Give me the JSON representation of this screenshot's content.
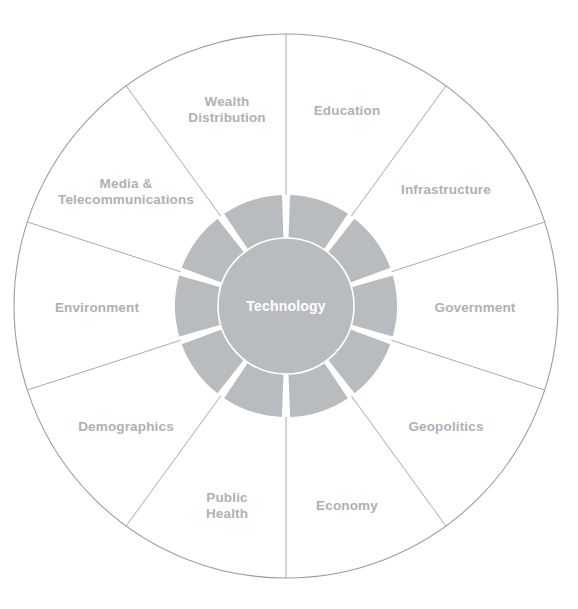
{
  "diagram": {
    "type": "radial-wheel",
    "hub": {
      "label": "Technology",
      "text_color": "#ffffff"
    },
    "colors": {
      "background": "#ffffff",
      "ring_fill": "#b9bcbe",
      "hub_fill": "#b9bcbe",
      "hub_stroke": "#ffffff",
      "outer_stroke": "#9a9da0",
      "spoke_stroke": "#a8abae",
      "label_text": "#aeb1b4",
      "ring_gap": "#ffffff"
    },
    "geometry": {
      "center_x": 286,
      "center_y": 306,
      "outer_radius": 272,
      "ring_outer_radius": 111,
      "hub_radius": 68,
      "label_radius": 198,
      "segment_count": 10,
      "segment_degrees": 36,
      "start_angle_deg": -90
    },
    "segments": [
      {
        "label": "Education",
        "index": 0,
        "angle_deg": -72,
        "label_x": 347,
        "label_y": 111,
        "lines": [
          "Education"
        ]
      },
      {
        "label": "Infrastructure",
        "index": 1,
        "angle_deg": -36,
        "label_x": 446,
        "label_y": 190,
        "lines": [
          "Infrastructure"
        ]
      },
      {
        "label": "Government",
        "index": 2,
        "angle_deg": 0,
        "label_x": 475,
        "label_y": 308,
        "lines": [
          "Government"
        ]
      },
      {
        "label": "Geopolitics",
        "index": 3,
        "angle_deg": 36,
        "label_x": 446,
        "label_y": 427,
        "lines": [
          "Geopolitics"
        ]
      },
      {
        "label": "Economy",
        "index": 4,
        "angle_deg": 72,
        "label_x": 347,
        "label_y": 506,
        "lines": [
          "Economy"
        ]
      },
      {
        "label": "Public Health",
        "index": 5,
        "angle_deg": 108,
        "label_x": 227,
        "label_y": 506,
        "lines": [
          "Public",
          "Health"
        ]
      },
      {
        "label": "Demographics",
        "index": 6,
        "angle_deg": 144,
        "label_x": 126,
        "label_y": 427,
        "lines": [
          "Demographics"
        ]
      },
      {
        "label": "Environment",
        "index": 7,
        "angle_deg": 180,
        "label_x": 97,
        "label_y": 308,
        "lines": [
          "Environment"
        ]
      },
      {
        "label": "Media & Telecommunications",
        "index": 8,
        "angle_deg": 216,
        "label_x": 126,
        "label_y": 192,
        "lines": [
          "Media &",
          "Telecommunications"
        ]
      },
      {
        "label": "Wealth Distribution",
        "index": 9,
        "angle_deg": 252,
        "label_x": 227,
        "label_y": 110,
        "lines": [
          "Wealth",
          "Distribution"
        ]
      }
    ]
  }
}
